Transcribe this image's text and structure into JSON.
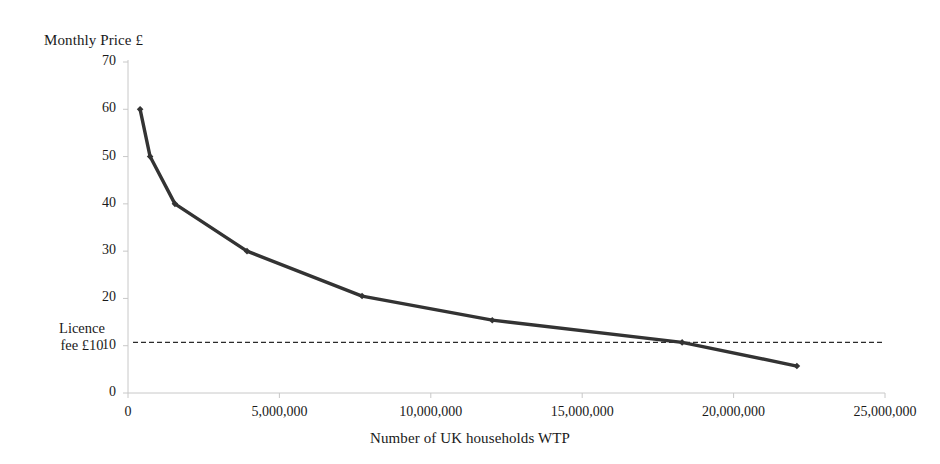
{
  "chart_data": {
    "type": "line",
    "title": "",
    "ylabel": "Monthly Price £",
    "xlabel": "Number of UK households WTP",
    "xlim": [
      0,
      25000000
    ],
    "ylim": [
      0,
      70
    ],
    "grid": false,
    "legend": null,
    "x_ticks": [
      "0",
      "5,000,000",
      "10,000,000",
      "15,000,000",
      "20,000,000",
      "25,000,000"
    ],
    "x_tick_values": [
      0,
      5000000,
      10000000,
      15000000,
      20000000,
      25000000
    ],
    "y_ticks": [
      "0",
      "10",
      "20",
      "30",
      "40",
      "50",
      "60",
      "70"
    ],
    "y_tick_values": [
      0,
      10,
      20,
      30,
      40,
      50,
      60,
      70
    ],
    "series": [
      {
        "name": "Willingness to pay curve",
        "marker": "diamond",
        "color": "#333333",
        "x": [
          400000,
          730000,
          1550000,
          3930000,
          7730000,
          12030000,
          18300000,
          22090000
        ],
        "y": [
          60,
          50,
          40,
          30,
          20.5,
          15.4,
          10.7,
          5.7
        ]
      }
    ],
    "annotations": [
      {
        "name": "licence-fee-line",
        "type": "hline",
        "value": 10.7,
        "style": "dashed",
        "color": "#2b2b2b",
        "label_line1": "Licence",
        "label_line2": "fee £10"
      }
    ]
  },
  "labels": {
    "y_axis_title": "Monthly Price £",
    "x_axis_title": "Number of UK households WTP",
    "licence_line1": "Licence",
    "licence_line2": "fee £10"
  },
  "colors": {
    "series": "#333333",
    "axis": "#c8c8c8",
    "text": "#1a1a1a",
    "dashed": "#2b2b2b",
    "background": "#ffffff"
  }
}
